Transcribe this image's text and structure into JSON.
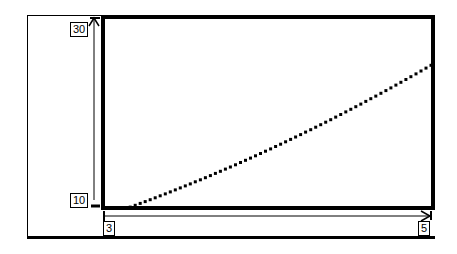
{
  "chart_data": {
    "type": "line",
    "title": "",
    "xlabel": "",
    "ylabel": "",
    "xlim": [
      3,
      5
    ],
    "ylim": [
      10,
      30
    ],
    "x_ticks": [
      "3",
      "5"
    ],
    "y_ticks": [
      "10",
      "30"
    ],
    "grid": false,
    "legend": null,
    "line_style": "dotted",
    "series": [
      {
        "name": "y = x^2",
        "x": [
          3.16,
          3.5,
          3.75,
          4.0,
          4.25,
          4.5,
          4.75,
          5.0
        ],
        "y": [
          10.0,
          12.25,
          14.06,
          16.0,
          18.06,
          20.25,
          22.56,
          25.0
        ]
      }
    ]
  },
  "axes": {
    "x_min_label": "3",
    "x_max_label": "5",
    "y_min_label": "10",
    "y_max_label": "30"
  }
}
